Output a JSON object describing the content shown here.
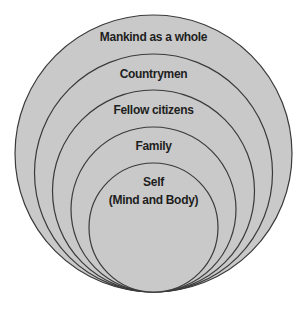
{
  "diagram": {
    "type": "nested-concentric-circles",
    "title": "",
    "colors": {
      "fill": "#c9c9c9",
      "stroke": "#3a3a3a",
      "text": "#1e1e1e",
      "background": "#ffffff"
    },
    "circles": [
      {
        "label": "Mankind as a whole"
      },
      {
        "label": "Countrymen"
      },
      {
        "label": "Fellow citizens"
      },
      {
        "label": "Family"
      },
      {
        "label": "Self",
        "sublabel": "(Mind and Body)"
      }
    ]
  }
}
